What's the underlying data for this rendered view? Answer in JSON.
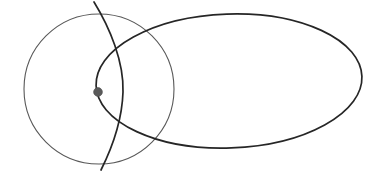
{
  "figure": {
    "background_color": "#ffffff",
    "width": 380,
    "height": 178
  },
  "chart_data": {
    "type": "scatter",
    "title": "",
    "xlabel": "",
    "ylabel": "",
    "xlim": [
      0,
      380
    ],
    "ylim": [
      0,
      178
    ],
    "grid": false,
    "legend": null,
    "shapes": [
      {
        "name": "small-circle",
        "kind": "circle",
        "cx": 99,
        "cy": 89,
        "r": 75,
        "stroke": "#585858",
        "stroke_width": 1.1,
        "fill": "none"
      },
      {
        "name": "large-ellipse",
        "kind": "ellipse",
        "cx": 229,
        "cy": 81,
        "rx": 133,
        "ry": 67,
        "rotation": -2,
        "stroke": "#262626",
        "stroke_width": 1.7,
        "fill": "none"
      },
      {
        "name": "vertical-arc",
        "kind": "arc",
        "start": [
          94,
          2
        ],
        "end": [
          101,
          170
        ],
        "bulge_x": 122,
        "path": "M 94 2 C 110 28 124 62 123 92 C 122 124 110 152 101 170",
        "stroke": "#262626",
        "stroke_width": 1.7,
        "fill": "none"
      }
    ],
    "points": [
      {
        "name": "marked-point",
        "x": 98,
        "y": 92,
        "r": 4.4,
        "color": "#5a5a5a",
        "label": ""
      }
    ]
  }
}
